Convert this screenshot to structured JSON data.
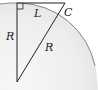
{
  "diagram": {
    "type": "geometry",
    "labels": {
      "tangent": "L",
      "point": "C",
      "vertical_side": "R",
      "hypotenuse": "R"
    },
    "colors": {
      "line": "#222222",
      "arc": "#888888",
      "fill": "#ececec"
    }
  }
}
